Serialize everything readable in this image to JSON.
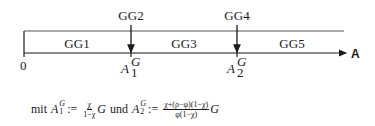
{
  "diagram": {
    "type": "number-line-regions",
    "axis_label": "A",
    "origin_label": "0",
    "regions": [
      {
        "label": "GG1"
      },
      {
        "label": "GG2"
      },
      {
        "label": "GG3"
      },
      {
        "label": "GG4"
      },
      {
        "label": "GG5"
      }
    ],
    "markers": [
      {
        "top_label": "GG2",
        "symbol": "A",
        "superscript": "G",
        "subscript": "1"
      },
      {
        "top_label": "GG4",
        "symbol": "A",
        "superscript": "G",
        "subscript": "2"
      }
    ],
    "colors": {
      "ink": "#1a1a1a",
      "background": "#ffffff"
    }
  },
  "formula": {
    "prefix": "mit",
    "a1": {
      "symbol": "A",
      "sup": "G",
      "sub": "1"
    },
    "assign": ":=",
    "frac1_num": "χ",
    "frac1_den": "1−χ",
    "g1": "G",
    "connector": "und",
    "a2": {
      "symbol": "A",
      "sup": "G",
      "sub": "2"
    },
    "frac2_num": "χ+(ρ−φ)(1−χ)",
    "frac2_den": "φ(1−χ)",
    "g2": "G"
  }
}
